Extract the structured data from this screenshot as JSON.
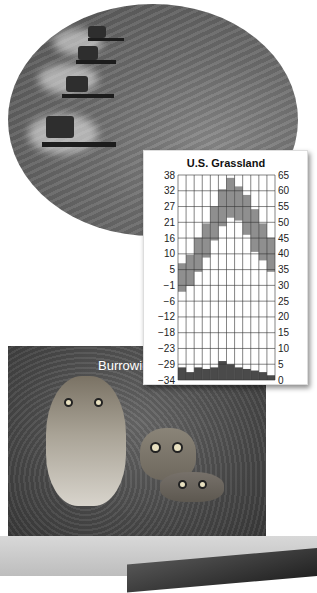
{
  "photos": {
    "harvest": {
      "label": "combine harvesters in grain field"
    },
    "owls": {
      "caption": "Burrowing owls"
    }
  },
  "chart_data": {
    "type": "bar",
    "title": "U.S. Grassland",
    "xlabel": "Month",
    "ylabel_left": "Temperature (°C)",
    "ylabel_right": "Precipitation (cm)",
    "categories": [
      "J",
      "F",
      "M",
      "A",
      "M",
      "J",
      "J",
      "A",
      "S",
      "O",
      "N",
      "D"
    ],
    "left_ticks": [
      38,
      32,
      27,
      21,
      16,
      10,
      5,
      -1,
      -6,
      -12,
      -18,
      -23,
      -29,
      -34
    ],
    "right_ticks": [
      65,
      60,
      55,
      50,
      45,
      40,
      35,
      30,
      25,
      20,
      15,
      10,
      5,
      0
    ],
    "ylim_left": [
      -34,
      38
    ],
    "ylim_right": [
      0,
      65
    ],
    "series": [
      {
        "name": "Temperature range (°C)",
        "type": "floating-bar",
        "color": "#8f8f8f",
        "low": [
          -3,
          -1,
          4,
          9,
          15,
          20,
          23,
          22,
          17,
          11,
          8,
          4
        ],
        "high": [
          7,
          10,
          16,
          21,
          27,
          33,
          37,
          34,
          31,
          26,
          21,
          16
        ]
      },
      {
        "name": "Precipitation (cm)",
        "type": "bar",
        "color": "#4a4a4a",
        "values": [
          4,
          2.5,
          4,
          3.5,
          4,
          6,
          5,
          4,
          3.5,
          3,
          2.5,
          1.5
        ]
      }
    ],
    "grid": true,
    "legend_position": "axis-side swatches"
  }
}
